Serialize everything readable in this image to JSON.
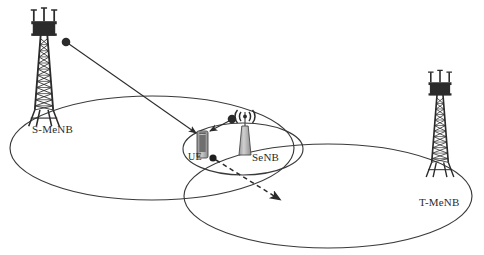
{
  "figure": {
    "type": "network-diagram",
    "title": "",
    "background_color": "#ffffff",
    "line_color": "#3a3a3a",
    "device_fill": "#a9a9a9",
    "tower_color": "#2b2b2b"
  },
  "labels": {
    "source_macro": "S-MeNB",
    "target_macro": "T-MeNB",
    "user_equipment": "UE",
    "small_cell": "SeNB"
  },
  "nodes": [
    {
      "id": "s-menb-tower",
      "name": "source-macro-tower",
      "label": "S-MeNB",
      "kind": "lattice-tower",
      "x": 44,
      "y": 12
    },
    {
      "id": "t-menb-tower",
      "name": "target-macro-tower",
      "label": "T-MeNB",
      "kind": "lattice-tower",
      "x": 440,
      "y": 74
    },
    {
      "id": "ue",
      "name": "user-equipment-handset",
      "label": "UE",
      "kind": "handset",
      "x": 203,
      "y": 138
    },
    {
      "id": "senb",
      "name": "small-cell-antenna",
      "label": "SeNB",
      "kind": "small-cell",
      "x": 245,
      "y": 140
    }
  ],
  "cells": [
    {
      "id": "source-macro-cell",
      "name": "source-macro-coverage-ellipse",
      "belongs_to": "S-MeNB",
      "cx": 152,
      "cy": 148,
      "rx": 142,
      "ry": 52
    },
    {
      "id": "target-macro-cell",
      "name": "target-macro-coverage-ellipse",
      "belongs_to": "T-MeNB",
      "cx": 328,
      "cy": 196,
      "rx": 144,
      "ry": 52
    },
    {
      "id": "small-cell",
      "name": "small-cell-coverage-ellipse",
      "belongs_to": "SeNB",
      "cx": 243,
      "cy": 149,
      "rx": 60,
      "ry": 26
    }
  ],
  "links": [
    {
      "id": "macro-link",
      "name": "macro-to-ue-link",
      "style": "solid-arrow",
      "from": "S-MeNB",
      "to": "UE",
      "from_point": [
        66,
        42
      ],
      "to_point": [
        198,
        134
      ]
    },
    {
      "id": "small-cell-link",
      "name": "small-cell-to-ue-link",
      "style": "solid-arrow",
      "from": "SeNB",
      "to": "UE",
      "from_point": [
        232,
        119
      ],
      "to_point": [
        208,
        132
      ]
    },
    {
      "id": "movement",
      "name": "ue-movement-direction",
      "style": "dashed-arrow",
      "from": "UE",
      "to": "T-MeNB coverage",
      "from_point": [
        213,
        158
      ],
      "to_point": [
        280,
        200
      ]
    }
  ]
}
